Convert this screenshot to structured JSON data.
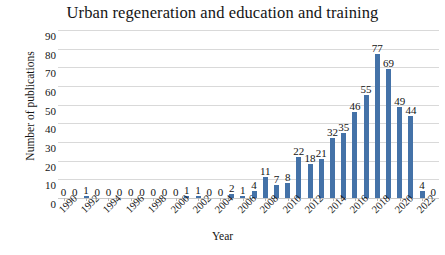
{
  "chart_data": {
    "type": "bar",
    "title": "Urban regeneration and education and training",
    "xlabel": "Year",
    "ylabel": "Number of publications",
    "ylim": [
      0,
      90
    ],
    "ytick_step": 10,
    "yticks": [
      "90",
      "80",
      "70",
      "60",
      "50",
      "40",
      "30",
      "20",
      "10",
      "0"
    ],
    "grid": true,
    "legend": "none",
    "bar_color": "#4472a8",
    "gridline_color": "#d9d9d9",
    "show_data_labels": true,
    "xtick_labels": [
      "1990",
      "1992",
      "1994",
      "1996",
      "1998",
      "2000",
      "2002",
      "2004",
      "2006",
      "2008",
      "2010",
      "2012",
      "2014",
      "2016",
      "2018",
      "2020",
      "2022"
    ],
    "categories": [
      "1990",
      "1991",
      "1992",
      "1993",
      "1994",
      "1995",
      "1996",
      "1997",
      "1998",
      "1999",
      "2000",
      "2001",
      "2002",
      "2003",
      "2004",
      "2005",
      "2006",
      "2007",
      "2008",
      "2009",
      "2010",
      "2011",
      "2012",
      "2013",
      "2014",
      "2015",
      "2016",
      "2017",
      "2018",
      "2019",
      "2020",
      "2021",
      "2022"
    ],
    "values": [
      0,
      0,
      1,
      0,
      0,
      0,
      0,
      0,
      0,
      0,
      0,
      1,
      1,
      0,
      0,
      2,
      1,
      4,
      11,
      7,
      8,
      22,
      18,
      21,
      32,
      35,
      46,
      55,
      77,
      69,
      49,
      44,
      4
    ],
    "labels": [
      "0",
      "0",
      "1",
      "0",
      "0",
      "0",
      "0",
      "0",
      "0",
      "0",
      "0",
      "1",
      "1",
      "0",
      "0",
      "2",
      "1",
      "4",
      "11",
      "7",
      "8",
      "22",
      "18",
      "21",
      "32",
      "35",
      "46",
      "55",
      "77",
      "69",
      "49",
      "44",
      "4"
    ],
    "trailing_label": "0",
    "trailing_category": "2022"
  }
}
